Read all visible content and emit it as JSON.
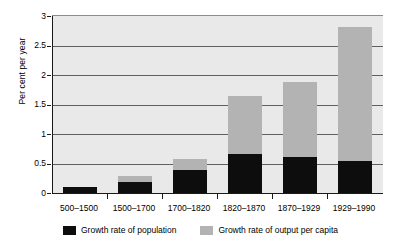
{
  "chart_data": {
    "type": "bar",
    "stacked": true,
    "title": "",
    "xlabel": "",
    "ylabel": "Per cent per year",
    "ylim": [
      0,
      3
    ],
    "yticks": [
      "0",
      "0.5",
      "1",
      "1.5",
      "2",
      "2.5",
      "3"
    ],
    "ytick_values": [
      0,
      0.5,
      1,
      1.5,
      2,
      2.5,
      3
    ],
    "grid": true,
    "legend_position": "bottom",
    "categories": [
      "500–1500",
      "1500–1700",
      "1700–1820",
      "1820–1870",
      "1870–1929",
      "1929–1990"
    ],
    "series": [
      {
        "name": "Growth rate of population",
        "color": "#0d0d0d",
        "values": [
          0.11,
          0.19,
          0.39,
          0.66,
          0.61,
          0.54
        ]
      },
      {
        "name": "Growth rate of output per capita",
        "color": "#b3b3b3",
        "values": [
          0.0,
          0.1,
          0.19,
          0.99,
          1.27,
          2.27
        ]
      }
    ],
    "totals": [
      0.11,
      0.29,
      0.58,
      1.65,
      1.88,
      2.81
    ],
    "plot_background": "#e9e9e9",
    "axis_color": "#1a1a1a",
    "gridline_color": "#606060"
  },
  "legend": {
    "items": [
      {
        "label": "Growth rate of population",
        "swatch": "black-square-icon"
      },
      {
        "label": "Growth rate of output per capita",
        "swatch": "gray-square-icon"
      }
    ]
  }
}
